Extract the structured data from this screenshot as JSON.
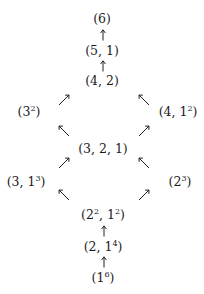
{
  "diagram": {
    "nodes": [
      {
        "id": "p6",
        "base": "(6)",
        "html_parts": [
          "(6)"
        ]
      },
      {
        "id": "p51",
        "parts": "(5, 1)"
      },
      {
        "id": "p42",
        "parts": "(4, 2)"
      },
      {
        "id": "p33",
        "parts": "(3",
        "exp": "2",
        "close": ")"
      },
      {
        "id": "p411",
        "parts": "(4, 1",
        "exp": "2",
        "close": ")"
      },
      {
        "id": "p321",
        "parts": "(3, 2, 1)"
      },
      {
        "id": "p3111",
        "parts": "(3, 1",
        "exp": "3",
        "close": ")"
      },
      {
        "id": "p222",
        "parts": "(2",
        "exp": "3",
        "close": ")"
      },
      {
        "id": "p2211_a",
        "parts": "(2",
        "exp": "2",
        "mid": ", 1",
        "exp2": "2",
        "close": ")"
      },
      {
        "id": "p21111",
        "parts": "(2, 1",
        "exp": "4",
        "close": ")"
      },
      {
        "id": "p111111",
        "parts": "(1",
        "exp": "6",
        "close": ")"
      }
    ],
    "edges": [
      {
        "from": "(5,1)",
        "to": "(6)",
        "direction": "up"
      },
      {
        "from": "(4,2)",
        "to": "(5,1)",
        "direction": "up"
      },
      {
        "from": "(3^2)",
        "to": "(4,2)",
        "direction": "up-right"
      },
      {
        "from": "(4,1^2)",
        "to": "(4,2)",
        "direction": "up-left"
      },
      {
        "from": "(3,2,1)",
        "to": "(3^2)",
        "direction": "up-left"
      },
      {
        "from": "(3,2,1)",
        "to": "(4,1^2)",
        "direction": "up-right"
      },
      {
        "from": "(3,1^3)",
        "to": "(3,2,1)",
        "direction": "up-right"
      },
      {
        "from": "(2^3)",
        "to": "(3,2,1)",
        "direction": "up-left"
      },
      {
        "from": "(2^2,1^2)",
        "to": "(3,1^3)",
        "direction": "up-left"
      },
      {
        "from": "(2^2,1^2)",
        "to": "(2^3)",
        "direction": "up-right"
      },
      {
        "from": "(2,1^4)",
        "to": "(2^2,1^2)",
        "direction": "up"
      },
      {
        "from": "(1^6)",
        "to": "(2,1^4)",
        "direction": "up"
      }
    ]
  }
}
